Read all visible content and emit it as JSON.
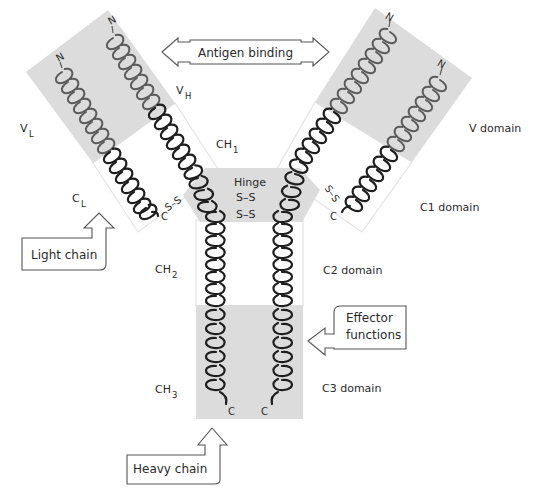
{
  "diagram": {
    "callouts": {
      "antigen_binding": "Antigen binding",
      "light_chain": "Light chain",
      "heavy_chain": "Heavy chain",
      "effector_line1": "Effector",
      "effector_line2": "functions"
    },
    "domain_labels": {
      "v_domain": "V domain",
      "c1_domain": "C1 domain",
      "c2_domain": "C2 domain",
      "c3_domain": "C3 domain"
    },
    "region_labels": {
      "vl_main": "V",
      "vl_sub": "L",
      "vh_main": "V",
      "vh_sub": "H",
      "cl_main": "C",
      "cl_sub": "L",
      "ch1_main": "CH",
      "ch1_sub": "1",
      "ch2_main": "CH",
      "ch2_sub": "2",
      "ch3_main": "CH",
      "ch3_sub": "3"
    },
    "hinge": {
      "label": "Hinge",
      "bond1": "S–S",
      "bond2": "S–S"
    },
    "terminals": {
      "n": "N",
      "c": "C",
      "ss": "S–S"
    },
    "colors": {
      "domain_shade": "#dcdcdc",
      "helix_dark": "#1e1e1e",
      "helix_grey": "#5a5a5a",
      "text": "#2a2a2a"
    }
  }
}
